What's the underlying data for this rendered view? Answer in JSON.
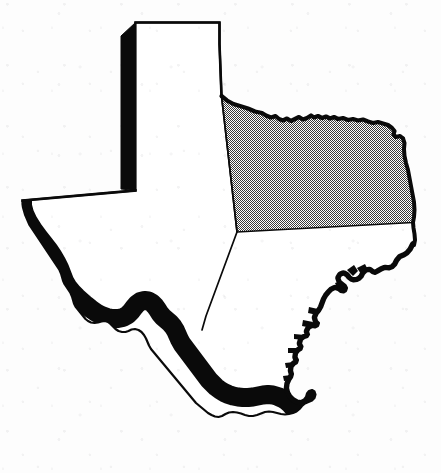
{
  "document": {
    "type": "scanned-map-figure",
    "subject": "Texas state outline map",
    "canvas": {
      "width": 441,
      "height": 473
    },
    "background_color": "#fdfdfd",
    "ink_color": "#000000"
  },
  "map": {
    "name": "texas-outline-map",
    "description": "Black-and-white outline map of the state of Texas with one interior region shaded with a stipple (halftone dot) pattern in the northeast quadrant.",
    "style": {
      "outline_color": "#0a0a0a",
      "fill_color": "#ffffff",
      "shaded_region_color": "#808080",
      "shade_pattern": "stipple-dots",
      "thin_stroke_width": 2.0,
      "medium_stroke_width": 2.6
    },
    "regions": [
      {
        "id": "shaded-northeast-region",
        "label": "Shaded northeast region",
        "fill": "stipple-dots",
        "interactable": false
      },
      {
        "id": "unshaded-remainder-region",
        "label": "Unshaded remainder of state",
        "fill": "white",
        "interactable": false
      }
    ],
    "borders": [
      {
        "id": "panhandle-north-border",
        "label": "Panhandle northern border",
        "weight": "thin"
      },
      {
        "id": "panhandle-west-border",
        "label": "Panhandle western border",
        "weight": "heavy"
      },
      {
        "id": "west-texas-south-border",
        "label": "West Texas southern state line",
        "weight": "thin"
      },
      {
        "id": "rio-grande-border",
        "label": "Rio Grande border",
        "weight": "heavy"
      },
      {
        "id": "gulf-coast-border",
        "label": "Gulf of Mexico coastline",
        "weight": "heavy"
      },
      {
        "id": "red-river-border",
        "label": "Red River northern border",
        "weight": "medium"
      },
      {
        "id": "eastern-state-border",
        "label": "Eastern state border",
        "weight": "medium"
      },
      {
        "id": "interior-division-line",
        "label": "Interior region division line",
        "weight": "thin"
      }
    ]
  },
  "geometry": {
    "state_outline_path": "M135.5,22.5 L219.5,22.5 L219.5,44.0 L220.5,70.0 L221.5,96.0 L227.0,100.5 L233.5,104.0 L240.0,106.0 L248.0,108.5 L255.0,111.5 L262.0,113.0 L266.0,115.5 L271.0,117.5 L275.5,116.0 L279.0,119.0 L283.0,120.5 L287.0,118.5 L291.0,121.0 L295.0,119.0 L299.0,117.0 L303.0,119.5 L307.0,118.0 L311.0,115.5 L314.0,117.5 L318.0,116.0 L322.0,118.0 L326.0,116.5 L330.0,118.5 L334.0,117.0 L338.0,119.0 L343.0,118.0 L348.0,120.0 L353.0,119.0 L358.0,120.5 L363.0,119.5 L368.0,121.5 L373.0,123.0 L378.0,122.0 L383.0,123.5 L388.0,125.0 L392.0,128.0 L394.5,131.0 L393.5,134.5 L396.0,137.0 L400.0,136.0 L403.0,138.5 L404.5,143.0 L404.0,149.0 L404.5,156.0 L406.0,163.0 L408.0,170.0 L409.5,178.0 L411.0,186.0 L412.5,194.0 L414.0,202.0 L414.5,210.0 L414.0,217.0 L413.0,222.5 L413.5,228.0 L414.5,234.0 L415.0,240.0 L414.0,245.0 L411.5,250.0 L408.0,254.0 L404.0,256.5 L400.5,258.0 L398.0,261.0 L396.0,265.0 L393.0,268.0 L389.0,269.5 L385.0,269.0 L381.5,270.5 L378.0,272.5 L375.0,274.0 L372.0,273.0 L369.5,271.0 L366.5,271.5 L364.0,274.0 L362.5,277.0 L360.0,279.5 L357.0,281.0 L353.5,281.5 L350.5,280.5 L348.0,278.5 L346.0,276.0 L343.5,274.5 L341.0,275.5 L339.5,278.0 L340.5,281.0 L343.0,283.0 L345.5,285.0 L347.0,288.0 L346.0,291.0 L343.5,292.5 L340.5,292.0 L338.0,290.0 L335.0,289.0 L332.0,290.5 L329.5,293.0 L327.0,296.0 L325.0,299.5 L323.5,303.5 L322.0,307.5 L320.0,311.0 L317.5,314.0 L316.0,317.5 L317.0,321.0 L319.0,323.0 L318.0,326.0 L315.0,327.5 L312.0,327.0 L309.5,328.5 L308.0,331.5 L309.0,334.5 L307.5,337.0 L304.5,338.0 L302.0,340.0 L301.0,343.5 L302.5,346.5 L301.5,349.5 L299.0,351.0 L297.0,353.5 L296.5,357.0 L298.0,360.0 L297.0,363.0 L294.5,364.5 L292.5,367.0 L292.0,370.5 L293.0,374.0 L292.0,377.5 L290.0,380.5 L288.5,384.0 L288.0,388.0 L289.0,392.0 L291.0,395.5 L294.0,398.5 L297.5,400.5 L301.0,401.0 L304.0,399.5 L306.0,397.0 L307.0,393.5 L309.0,391.0 L312.0,390.0 L314.5,391.5 L315.5,394.5 L314.5,398.0 L312.0,400.5 L308.5,402.0 L305.0,403.5 L302.0,406.0 L299.5,409.0 L296.5,411.5 L293.0,413.0 L289.0,414.0 L285.0,414.5 L281.0,414.0 L277.0,413.0 L273.0,412.0 L269.0,411.5 L265.0,412.0 L261.0,413.5 L257.0,415.0 L253.0,416.0 L249.0,416.0 L245.0,415.0 L241.0,413.5 L237.0,412.5 L233.0,412.0 L229.0,412.5 L225.5,414.0 L222.0,416.0 L218.5,417.0 L215.0,416.5 L211.5,415.0 L208.0,413.0 L205.0,410.5 L202.0,408.0 L199.0,405.5 L196.0,403.0 L193.5,400.0 L191.0,397.0 L188.5,394.0 L186.0,391.0 L183.5,388.0 L181.0,385.0 L178.5,382.0 L176.0,379.0 L173.5,376.0 L171.0,373.0 L168.5,370.0 L166.0,367.0 L163.5,364.0 L161.0,361.0 L158.5,358.0 L156.0,355.0 L153.5,352.0 L151.0,349.0 L149.0,345.5 L147.5,342.0 L146.0,338.5 L144.0,335.0 L141.5,332.0 L138.5,330.0 L135.0,329.0 L131.5,329.5 L128.5,331.0 L125.5,332.0 L122.0,332.0 L118.5,331.0 L115.5,329.0 L113.0,326.5 L110.5,324.0 L108.0,322.0 L105.0,321.0 L101.5,321.5 L98.0,322.5 L94.5,323.0 L91.0,322.5 L88.0,321.0 L85.5,319.0 L83.5,316.5 L81.5,314.0 L79.5,311.5 L77.5,309.0 L75.5,306.5 L74.0,303.5 L73.0,300.0 L72.0,296.5 L70.5,293.0 L68.5,290.0 L66.5,287.0 L64.5,284.0 L63.0,280.5 L62.0,277.0 L61.0,273.5 L59.5,270.0 L57.5,267.0 L55.5,264.0 L53.5,261.0 L51.5,258.0 L49.5,255.0 L47.5,252.0 L45.5,249.0 L43.5,246.0 L41.5,243.0 L39.5,240.0 L37.5,237.0 L35.5,234.0 L33.5,231.0 L31.5,228.0 L29.5,225.0 L28.0,221.5 L26.5,218.0 L25.0,214.5 L24.0,211.0 L23.0,207.5 L22.5,204.0 L22.5,200.5 L135.5,190.5 Z",
    "panhandle_west_border_path": "M135.5,22.5 L121.0,36.0 L121.0,189.0 L135.5,190.5 L135.5,22.5 Z",
    "rio_grande_path": "M22.5,200.5 L22.5,206.0 L24.5,213.5 L28.0,221.0 L33.0,229.0 L38.5,236.5 L44.0,243.5 L49.0,250.0 L53.0,256.0 L56.5,262.0 L59.5,268.0 L62.0,274.5 L64.5,281.0 L68.0,287.0 L72.5,292.5 L77.0,297.0 L81.5,301.0 L86.0,305.0 L91.0,309.0 L96.0,312.5 L101.5,315.5 L107.0,317.5 L112.5,318.5 L118.0,318.5 L123.0,317.5 L127.5,315.0 L131.0,311.5 L134.0,307.5 L137.0,304.0 L140.5,301.5 L144.5,300.5 L148.5,301.0 L152.0,303.0 L155.0,306.0 L157.5,309.5 L160.0,313.5 L163.0,317.0 L166.5,320.0 L170.0,323.0 L173.0,326.5 L175.5,330.5 L177.5,335.0 L179.5,339.5 L182.0,344.0 L185.0,348.0 L188.0,352.0 L191.0,356.0 L194.0,360.0 L197.0,364.0 L200.0,368.0 L203.0,372.0 L206.0,376.0 L209.0,380.0 L212.5,383.5 L216.0,387.0 L220.0,390.0 L224.0,392.5 L228.5,394.5 L233.0,396.0 L238.0,397.0 L243.0,397.5 L248.0,397.5 L253.0,397.0 L258.0,396.0 L263.0,395.0 L268.0,394.5 L273.0,395.0 L278.0,396.5 L282.5,398.5 L286.5,401.0 L290.0,404.0 L293.0,407.5 L295.5,411.0",
    "shaded_region_path": "M221.5,96.0 L227.0,100.5 L233.5,104.0 L240.0,106.0 L248.0,108.5 L255.0,111.5 L262.0,113.0 L266.0,115.5 L271.0,117.5 L275.5,116.0 L279.0,119.0 L283.0,120.5 L287.0,118.5 L291.0,121.0 L295.0,119.0 L299.0,117.0 L303.0,119.5 L307.0,118.0 L311.0,115.5 L314.0,117.5 L318.0,116.0 L322.0,118.0 L326.0,116.5 L330.0,118.5 L334.0,117.0 L338.0,119.0 L343.0,118.0 L348.0,120.0 L353.0,119.0 L358.0,120.5 L363.0,119.5 L368.0,121.5 L373.0,123.0 L378.0,122.0 L383.0,123.5 L388.0,125.0 L392.0,128.0 L394.5,131.0 L393.5,134.5 L396.0,137.0 L400.0,136.0 L403.0,138.5 L404.5,143.0 L404.0,149.0 L404.5,156.0 L406.0,163.0 L408.0,170.0 L409.5,178.0 L411.0,186.0 L412.5,194.0 L414.0,202.0 L414.5,210.0 L414.0,217.0 L413.0,222.5 L237.0,232.0 Z",
    "interior_division_line_path": "M221.5,96.0 L237.0,232.0 L206.0,316.0 L202.0,330.0"
  }
}
